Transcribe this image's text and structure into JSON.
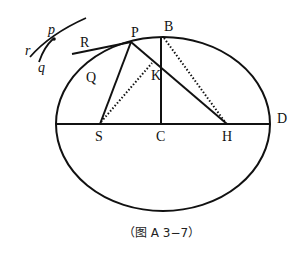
{
  "figure": {
    "caption": "（图 A 3−7）",
    "points": {
      "P": "P",
      "B": "B",
      "R": "R",
      "Q": "Q",
      "K": "K",
      "S": "S",
      "C": "C",
      "H": "H",
      "D": "D"
    },
    "inset_labels": {
      "p": "p",
      "r": "r",
      "q": "q"
    },
    "colors": {
      "stroke": "#111111",
      "background": "#ffffff"
    }
  }
}
